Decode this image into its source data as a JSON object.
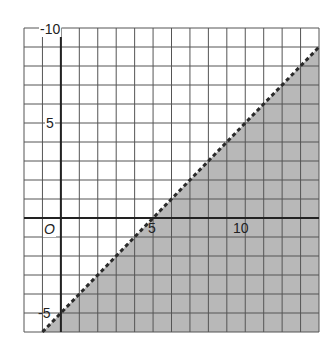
{
  "chart_data": {
    "type": "line",
    "title": "",
    "xlabel": "",
    "ylabel": "",
    "xlim": [
      -2,
      14
    ],
    "ylim": [
      -6,
      10
    ],
    "grid": true,
    "grid_step": 1,
    "x_tick_labels": [
      {
        "value": 5,
        "label": "5"
      },
      {
        "value": 10,
        "label": "10"
      }
    ],
    "y_tick_labels": [
      {
        "value": 10,
        "label": "-10"
      },
      {
        "value": 5,
        "label": "5"
      },
      {
        "value": -5,
        "label": "-5"
      }
    ],
    "origin_label": "O",
    "series": [
      {
        "name": "boundary",
        "equation": "y = x - 5",
        "style": "dashed",
        "x": [
          -1,
          14
        ],
        "y": [
          -6,
          9
        ]
      }
    ],
    "inequality": "y < x - 5",
    "shaded_region": "below line",
    "legend": []
  },
  "colors": {
    "background": "#ffffff",
    "grid": "#555555",
    "axis": "#222222",
    "shade": "#b8b8b8",
    "boundary_line": "#2a2a2a",
    "label": "#222222"
  },
  "labels": {
    "y_top": "-10",
    "y_mid": "5",
    "y_bottom": "-5",
    "x_mid": "5",
    "x_right": "10",
    "origin": "O"
  }
}
